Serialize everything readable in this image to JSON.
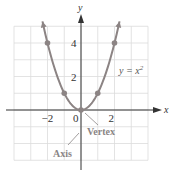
{
  "chart_data": {
    "type": "line",
    "title": "",
    "equation": "y = x²",
    "equation_base": "y = x",
    "equation_exp": "2",
    "xlabel": "x",
    "ylabel": "y",
    "xlim": [
      -4,
      4
    ],
    "ylim": [
      -3,
      5
    ],
    "grid": true,
    "x_ticks": [
      {
        "value": -2,
        "label": "−2"
      },
      {
        "value": 0,
        "label": "0"
      },
      {
        "value": 2,
        "label": "2"
      }
    ],
    "y_ticks": [
      {
        "value": 2,
        "label": "2"
      },
      {
        "value": 4,
        "label": "4"
      }
    ],
    "series": [
      {
        "name": "y = x^2",
        "function": "x^2",
        "x_range": [
          -2.3,
          2.3
        ],
        "points": [
          {
            "x": -2,
            "y": 4
          },
          {
            "x": -1,
            "y": 1
          },
          {
            "x": 0,
            "y": 0
          },
          {
            "x": 1,
            "y": 1
          },
          {
            "x": 2,
            "y": 4
          }
        ]
      }
    ],
    "annotations": [
      {
        "text": "Vertex",
        "target": {
          "x": 0,
          "y": 0
        }
      },
      {
        "text": "Axis",
        "target": "x = 0"
      }
    ]
  },
  "colors": {
    "curve": "#8c8484",
    "grid": "#dcdcdc",
    "axis": "#333333",
    "annotation": "#8a8585"
  }
}
